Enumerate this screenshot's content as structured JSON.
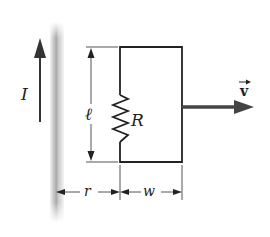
{
  "diagram": {
    "type": "physics-circuit",
    "labels": {
      "current": "I",
      "length": "ℓ",
      "resistance": "R",
      "velocity": "v",
      "distance": "r",
      "width": "w"
    },
    "colors": {
      "line": "#222222",
      "wire_shade": "#b8b8b8",
      "background": "#ffffff"
    }
  }
}
